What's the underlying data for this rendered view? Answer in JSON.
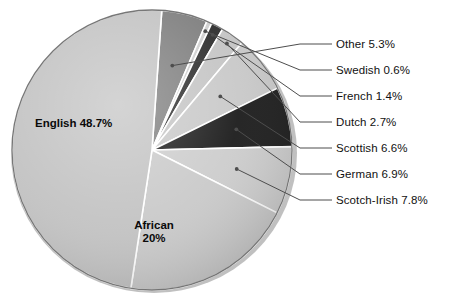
{
  "chart_data": {
    "type": "pie",
    "title": "",
    "subtitle": "",
    "xlabel": "",
    "ylabel": "",
    "legend_position": "callout-right",
    "grid": false,
    "units": "percent",
    "total": 100,
    "start_angle_deg": -86,
    "direction": "clockwise",
    "categories": [
      "Other",
      "Swedish",
      "French",
      "Dutch",
      "Scottish",
      "German",
      "Scotch-Irish",
      "African",
      "English"
    ],
    "values": [
      5.3,
      0.6,
      1.4,
      2.7,
      6.6,
      6.9,
      7.8,
      20,
      48.7
    ],
    "slices": [
      {
        "label": "Other",
        "value": 5.3,
        "value_text": "5.3%",
        "label_text": "Other 5.3%",
        "color": "#7d7d7d",
        "placement": "callout"
      },
      {
        "label": "Swedish",
        "value": 0.6,
        "value_text": "0.6%",
        "label_text": "Swedish 0.6%",
        "color": "#cfcfcf",
        "placement": "callout"
      },
      {
        "label": "French",
        "value": 1.4,
        "value_text": "1.4%",
        "label_text": "French 1.4%",
        "color": "#2b2b2b",
        "placement": "callout"
      },
      {
        "label": "Dutch",
        "value": 2.7,
        "value_text": "2.7%",
        "label_text": "Dutch 2.7%",
        "color": "#c4c4c4",
        "placement": "callout"
      },
      {
        "label": "Scottish",
        "value": 6.6,
        "value_text": "6.6%",
        "label_text": "Scottish 6.6%",
        "color": "#c8c8c8",
        "placement": "callout"
      },
      {
        "label": "German",
        "value": 6.9,
        "value_text": "6.9%",
        "label_text": "German 6.9%",
        "color": "#191919",
        "placement": "callout"
      },
      {
        "label": "Scotch-Irish",
        "value": 7.8,
        "value_text": "7.8%",
        "label_text": "Scotch-Irish 7.8%",
        "color": "#cccccc",
        "placement": "callout"
      },
      {
        "label": "African",
        "value": 20,
        "value_text": "20%",
        "label_text": "African 20%",
        "color": "#c9c9c9",
        "placement": "inside"
      },
      {
        "label": "English",
        "value": 48.7,
        "value_text": "48.7%",
        "label_text": "English 48.7%",
        "color": "#c2c2c2",
        "placement": "inside"
      }
    ]
  },
  "inner_labels": {
    "english": {
      "name": "English",
      "value_text": "48.7%",
      "full": "English 48.7%"
    },
    "african": {
      "name": "African",
      "value_text": "20%",
      "full": "African 20%"
    }
  },
  "callouts": [
    {
      "text": "Other 5.3%"
    },
    {
      "text": "Swedish 0.6%"
    },
    {
      "text": "French 1.4%"
    },
    {
      "text": "Dutch 2.7%"
    },
    {
      "text": "Scottish 6.6%"
    },
    {
      "text": "German 6.9%"
    },
    {
      "text": "Scotch-Irish 7.8%"
    }
  ],
  "style": {
    "background": "#ffffff",
    "text_color": "#111111",
    "leader_line_color": "#4d4d4d",
    "slice_edge_color": "#ffffff",
    "pie_rim_color": "#5a5a5a"
  }
}
